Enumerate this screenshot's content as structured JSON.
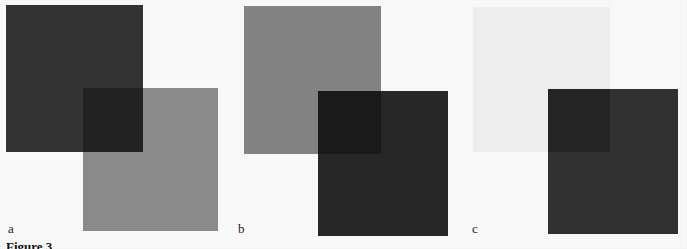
{
  "figure": {
    "caption": "Figure 3",
    "background_color": "#ffffff",
    "width": 687,
    "height": 249
  },
  "panels": [
    {
      "label": "a",
      "label_x": 8,
      "label_y": 222,
      "back_square": {
        "name": "upper-left-square",
        "color": "#353535",
        "x": 6,
        "y": 5,
        "w": 137,
        "h": 147
      },
      "front_square": {
        "name": "lower-right-square",
        "color": "#8e8e8e",
        "x": 83,
        "y": 88,
        "w": 135,
        "h": 143
      },
      "overlap_square": {
        "name": "overlap-region",
        "color": "#232323",
        "x": 83,
        "y": 88,
        "w": 60,
        "h": 64
      }
    },
    {
      "label": "b",
      "label_x": 238,
      "label_y": 222,
      "back_square": {
        "name": "upper-left-square",
        "color": "#868686",
        "x": 244,
        "y": 6,
        "w": 137,
        "h": 148
      },
      "front_square": {
        "name": "lower-right-square",
        "color": "#282828",
        "x": 318,
        "y": 91,
        "w": 130,
        "h": 145
      },
      "overlap_square": {
        "name": "overlap-region",
        "color": "#1b1b1b",
        "x": 318,
        "y": 91,
        "w": 63,
        "h": 63
      }
    },
    {
      "label": "c",
      "label_x": 472,
      "label_y": 222,
      "back_square": {
        "name": "upper-left-square",
        "color": "#f4f4f4",
        "x": 473,
        "y": 7,
        "w": 137,
        "h": 145
      },
      "front_square": {
        "name": "lower-right-square",
        "color": "#333333",
        "x": 548,
        "y": 89,
        "w": 130,
        "h": 145
      },
      "overlap_square": {
        "name": "overlap-region",
        "color": "#262626",
        "x": 548,
        "y": 89,
        "w": 62,
        "h": 63
      }
    }
  ]
}
